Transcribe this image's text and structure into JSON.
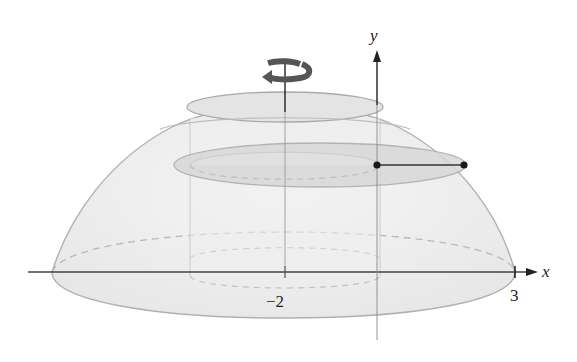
{
  "figure": {
    "type": "solid-of-revolution",
    "axes": {
      "x_label": "x",
      "y_label": "y"
    },
    "ticks": {
      "x_axis_of_rotation": "−2",
      "x_right": "3"
    },
    "rotation_icon": "rotation-arrow-icon",
    "colors": {
      "solid_fill": "#ececec",
      "solid_edge": "#a8a8a8",
      "slice_fill": "#d9d9d9",
      "axis": "#333333",
      "point": "#1a1a1a"
    }
  }
}
